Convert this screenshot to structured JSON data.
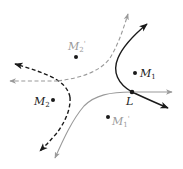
{
  "diagram": {
    "colors": {
      "black": "#1a1a1a",
      "gray": "#9a9a9a",
      "background": "#ffffff"
    },
    "points": [
      {
        "id": "M1",
        "label": "M",
        "sub": "1",
        "prime": "",
        "color": "black",
        "x": 135,
        "y": 73
      },
      {
        "id": "M2",
        "label": "M",
        "sub": "2",
        "prime": "",
        "color": "black",
        "x": 53,
        "y": 100
      },
      {
        "id": "M1p",
        "label": "M",
        "sub": "1",
        "prime": "'",
        "color": "gray",
        "x": 108,
        "y": 117
      },
      {
        "id": "M2p",
        "label": "M",
        "sub": "2",
        "prime": "'",
        "color": "gray",
        "x": 76,
        "y": 57
      },
      {
        "id": "L",
        "label": "L",
        "sub": "",
        "prime": "",
        "color": "black",
        "x": 132,
        "y": 92
      }
    ],
    "curves": [
      {
        "id": "black-solid-hyperbola-branch",
        "color": "black",
        "style": "solid"
      },
      {
        "id": "gray-solid-hyperbola-branch",
        "color": "gray",
        "style": "solid"
      },
      {
        "id": "black-dashed-hyperbola-branch",
        "color": "black",
        "style": "dashed"
      },
      {
        "id": "gray-dashed-hyperbola-branch",
        "color": "gray",
        "style": "dashed"
      }
    ]
  }
}
